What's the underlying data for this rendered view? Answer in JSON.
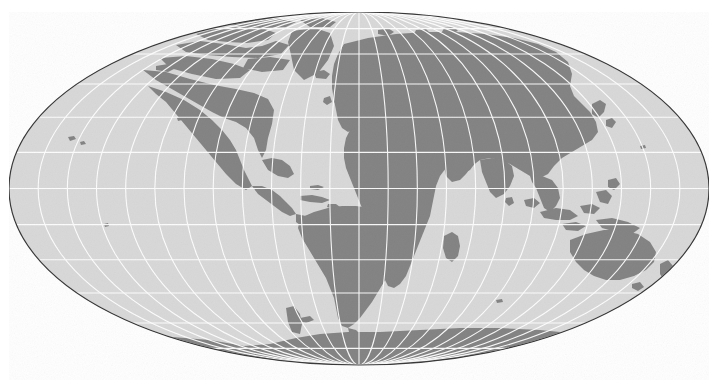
{
  "figure": {
    "kind": "world-map",
    "title": "",
    "width": 718,
    "height": 380,
    "background_color": "#ffffff"
  },
  "chart_data": {
    "type": "map",
    "title": "",
    "subtitle": "",
    "xlabel": "",
    "ylabel": "",
    "projection": "Mollweide",
    "central_meridian": 0,
    "central_parallel": 0,
    "extent_degrees": {
      "lon_min": -180,
      "lon_max": 180,
      "lat_min": -90,
      "lat_max": 90
    },
    "ellipse": {
      "cx": 359,
      "cy": 188.5,
      "rx": 350,
      "ry": 176.5
    },
    "graticule": {
      "visible": true,
      "spacing_degrees": 15,
      "meridians": [
        -180,
        -165,
        -150,
        -135,
        -120,
        -105,
        -90,
        -75,
        -60,
        -45,
        -30,
        -15,
        0,
        15,
        30,
        45,
        60,
        75,
        90,
        105,
        120,
        135,
        150,
        165,
        180
      ],
      "parallels": [
        -75,
        -60,
        -45,
        -30,
        -15,
        0,
        15,
        30,
        45,
        60,
        75
      ],
      "color": "#ffffff",
      "line_width": 1.1
    },
    "legend": {
      "visible": false,
      "position": "none"
    },
    "layers": [
      {
        "name": "ocean",
        "label": "Ocean",
        "color": "#d9d9d9"
      },
      {
        "name": "land",
        "label": "Land",
        "color": "#858585"
      },
      {
        "name": "border",
        "label": "Map outline",
        "color": "#3a3a3a"
      }
    ],
    "annotations": [],
    "tick_labels": {
      "meridian_labels": [],
      "parallel_labels": []
    },
    "landmasses": [
      "North America",
      "South America",
      "Greenland",
      "Eurasia",
      "Africa",
      "Australia",
      "Antarctica",
      "Madagascar",
      "New Guinea",
      "Japan",
      "British Isles",
      "New Zealand",
      "Indonesia",
      "Philippines",
      "Iceland",
      "Sri Lanka",
      "Cuba",
      "Svalbard",
      "Tasmania",
      "Hawaii"
    ]
  },
  "colors": {
    "land": "#858585",
    "ocean": "#d9d9d9",
    "graticule": "#ffffff",
    "outline": "#3a3a3a",
    "page_background": "#ffffff"
  }
}
